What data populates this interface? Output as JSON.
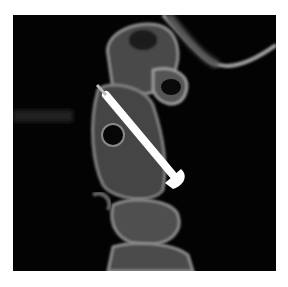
{
  "image": {
    "subject": "sagittal CT of upper cervical spine with transarticular screw",
    "background_color": "#030303",
    "bone_color": "#8a8a8a",
    "screw_color": "#ffffff",
    "page_color": "#ffffff"
  }
}
